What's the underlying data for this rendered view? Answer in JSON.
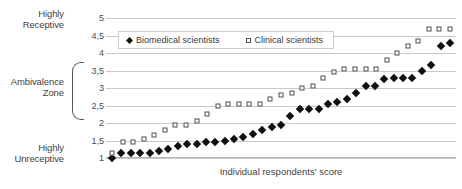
{
  "chart_data": {
    "type": "scatter",
    "title": "",
    "xlabel": "Individual respondents' score",
    "ylabel": "",
    "ylim": [
      1,
      5
    ],
    "yticks": [
      1,
      1.5,
      2,
      2.5,
      3,
      3.5,
      4,
      4.5,
      5
    ],
    "ytick_labels": [
      "1",
      "1,5",
      "2",
      "2,5",
      "3",
      "3,5",
      "4",
      "4,5",
      "5"
    ],
    "grid": true,
    "legend_position": "top-left",
    "zone_annotations": [
      {
        "name": "highly-receptive",
        "label": "Highly\nReceptive",
        "position": "top"
      },
      {
        "name": "ambivalence-zone",
        "label": "Ambivalence\nZone",
        "position": "middle",
        "range": [
          2.5,
          3.5
        ],
        "bracket": true
      },
      {
        "name": "highly-unreceptive",
        "label": "Highly\nUnreceptive",
        "position": "bottom"
      }
    ],
    "series": [
      {
        "name": "Biomedical scientists",
        "marker": "filled-diamond",
        "color": "#101010",
        "values": [
          1.0,
          1.15,
          1.15,
          1.15,
          1.15,
          1.2,
          1.25,
          1.35,
          1.4,
          1.4,
          1.45,
          1.45,
          1.5,
          1.55,
          1.6,
          1.7,
          1.8,
          1.9,
          1.95,
          2.2,
          2.4,
          2.4,
          2.4,
          2.55,
          2.6,
          2.7,
          2.85,
          3.05,
          3.05,
          3.25,
          3.3,
          3.3,
          3.3,
          3.5,
          3.65,
          4.2,
          4.3
        ]
      },
      {
        "name": "Clinical scientists",
        "marker": "open-square",
        "color": "#4d4d4d",
        "values": [
          1.15,
          1.45,
          1.45,
          1.55,
          1.65,
          1.8,
          1.95,
          1.95,
          2.05,
          2.25,
          2.5,
          2.55,
          2.55,
          2.55,
          2.55,
          2.7,
          2.8,
          2.85,
          3.0,
          3.05,
          3.3,
          3.45,
          3.55,
          3.55,
          3.55,
          3.55,
          3.8,
          4.0,
          4.2,
          4.35,
          4.7,
          4.7,
          4.7
        ]
      }
    ]
  },
  "legend": {
    "entries": [
      {
        "label": "Biomedical scientists",
        "marker": "filled-diamond"
      },
      {
        "label": "Clinical scientists",
        "marker": "open-square"
      }
    ]
  },
  "axis": {
    "x_title": "Individual respondents' score"
  },
  "side_labels": {
    "receptive": "Highly\nReceptive",
    "ambivalence": "Ambivalence\nZone",
    "unreceptive": "Highly\nUnreceptive"
  },
  "colors": {
    "grid": "#c9c9c9",
    "marker_fill": "#101010",
    "marker_outline": "#4d4d4d",
    "text": "#4a4a4a",
    "background": "#ffffff"
  }
}
